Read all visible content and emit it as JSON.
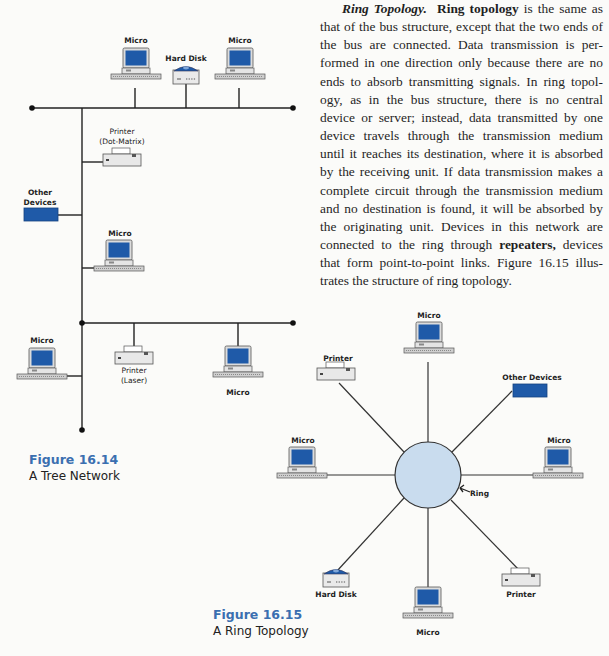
{
  "body_text": {
    "heading": "Ring Topology.",
    "term_1": "Ring topology",
    "part_1": " is the same as that of the bus structure, except that the two ends of the bus are connected. Data transmission is per-formed in one direction only because there are no ends to absorb transmitting signals. In ring topol-ogy, as in the bus structure, there is no central device or server; instead, data transmitted by one device travels through the transmission medium until it reaches its destination, where it is absorbed by the receiving unit. If data transmission makes a complete circuit through the transmission medium and no destination is found, it will be absorbed by the originating unit. Devices in this network are connected to the ring through ",
    "term_2": "repeaters,",
    "part_2": " devices that form point-to-point links. Figure 16.15 illus-trates the structure of ring topology."
  },
  "figure_14": {
    "number": "Figure 16.14",
    "title": "A Tree Network",
    "labels": {
      "micro_top_left": "Micro",
      "hard_disk": "Hard Disk",
      "micro_top_right": "Micro",
      "printer_dot_1": "Printer",
      "printer_dot_2": "(Dot-Matrix)",
      "other_devices_1": "Other",
      "other_devices_2": "Devices",
      "micro_mid": "Micro",
      "micro_bottom_left": "Micro",
      "printer_laser_1": "Printer",
      "printer_laser_2": "(Laser)",
      "micro_bottom_right": "Micro"
    }
  },
  "figure_15": {
    "number": "Figure 16.15",
    "title": "A Ring Topology",
    "labels": {
      "micro_top": "Micro",
      "printer_top_left": "Printer",
      "other_devices": "Other Devices",
      "micro_left": "Micro",
      "micro_right": "Micro",
      "ring": "Ring",
      "hard_disk": "Hard Disk",
      "micro_bottom": "Micro",
      "printer_bottom_right": "Printer"
    }
  },
  "colors": {
    "monitor_blue": "#1f5aa8",
    "ring_fill": "#c9dcee",
    "caption_blue": "#3a6fb0"
  }
}
